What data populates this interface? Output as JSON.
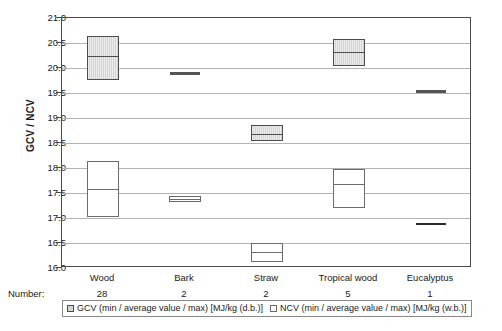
{
  "chart_data": {
    "type": "bar",
    "title": "",
    "xlabel": "",
    "ylabel": "GCV / NCV",
    "ylim": [
      16.0,
      21.0
    ],
    "ytick_labels": [
      "21.0",
      "20.5",
      "20.0",
      "19.5",
      "19.0",
      "18.5",
      "18.0",
      "17.5",
      "17.0",
      "16.5",
      "16.0"
    ],
    "ytick_values": [
      21.0,
      20.5,
      20.0,
      19.5,
      19.0,
      18.5,
      18.0,
      17.5,
      17.0,
      16.5,
      16.0
    ],
    "grid": true,
    "legend_position": "bottom",
    "categories": [
      "Wood",
      "Bark",
      "Straw",
      "Tropical wood",
      "Eucalyptus"
    ],
    "number_row_label": "Number:",
    "numbers": [
      "28",
      "2",
      "2",
      "5",
      "1"
    ],
    "series": [
      {
        "name": "GCV (min / average value / max) [MJ/kg (d.b.)]",
        "short_name": "GCV",
        "unit": "MJ/kg (d.b.)",
        "color": "#d4d4d4",
        "border_color": "#4d4d4d",
        "min": [
          19.77,
          19.9,
          18.55,
          20.05,
          19.53
        ],
        "average": [
          20.25,
          19.9,
          18.68,
          20.32,
          19.53
        ],
        "max": [
          20.65,
          19.9,
          18.87,
          20.58,
          19.53
        ]
      },
      {
        "name": "NCV (min / average value / max) [MJ/kg (w.b.)]",
        "short_name": "NCV",
        "unit": "MJ/kg (w.b.)",
        "color": "#ffffff",
        "border_color": "#6b6b6b",
        "min": [
          17.03,
          17.33,
          16.13,
          17.2,
          16.88
        ],
        "average": [
          17.58,
          17.39,
          16.32,
          17.68,
          16.88
        ],
        "max": [
          18.15,
          17.45,
          16.5,
          17.98,
          16.88
        ]
      }
    ]
  },
  "legend": {
    "gcv_label": "GCV (min / average value / max) [MJ/kg (d.b.)]",
    "ncv_label": "NCV (min / average value / max) [MJ/kg (w.b.)]"
  },
  "axis": {
    "y_title": "GCV / NCV"
  }
}
